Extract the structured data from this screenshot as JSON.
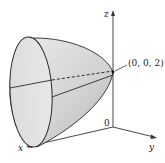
{
  "figure": {
    "axes": {
      "x_label": "x",
      "y_label": "y",
      "z_label": "z",
      "origin_label": "0"
    },
    "vertex_label": "(0, 0, 2)",
    "colors": {
      "surface_light": "#e4e4e4",
      "surface_dark": "#bdbdbd",
      "stroke": "#2a2a2a"
    }
  }
}
